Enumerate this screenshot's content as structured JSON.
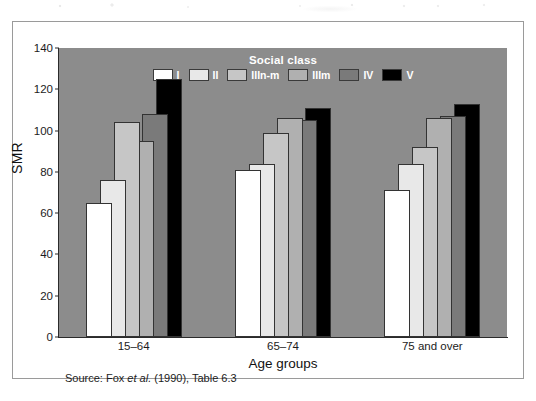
{
  "figure": {
    "source_note_prefix": "Source: Fox ",
    "source_note_italic": "et al.",
    "source_note_suffix": " (1990), Table 6.3",
    "plot_background": "#8c8c8c",
    "frame_background": "#ffffff"
  },
  "chart_data": {
    "type": "bar",
    "title": "",
    "xlabel": "Age groups",
    "ylabel": "SMR",
    "ylim": [
      0,
      140
    ],
    "ytick_step": 20,
    "yticks": [
      0,
      20,
      40,
      60,
      80,
      100,
      120,
      140
    ],
    "grid": false,
    "legend_title": "Social class",
    "legend_position": "top-center-inside",
    "bar_style": "overlapping-offset",
    "categories": [
      "15–64",
      "65–74",
      "75 and over"
    ],
    "series": [
      {
        "name": "I",
        "color": "#ffffff",
        "values": [
          65,
          81,
          71
        ]
      },
      {
        "name": "II",
        "color": "#e8e8e8",
        "values": [
          76,
          84,
          84
        ]
      },
      {
        "name": "IIIn-m",
        "color": "#c6c6c6",
        "values": [
          104,
          99,
          92
        ]
      },
      {
        "name": "IIIm",
        "color": "#b0b0b0",
        "values": [
          95,
          106,
          106
        ]
      },
      {
        "name": "IV",
        "color": "#7a7a7a",
        "values": [
          108,
          105,
          107
        ]
      },
      {
        "name": "V",
        "color": "#000000",
        "values": [
          125,
          111,
          113
        ]
      }
    ]
  }
}
